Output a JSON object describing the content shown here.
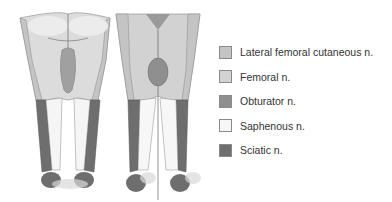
{
  "figure": {
    "posterior_view": "posterior legs",
    "anterior_view": "anterior legs"
  },
  "legend": {
    "items": [
      {
        "label": "Lateral femoral cutaneous n.",
        "color": "#c4c4c4"
      },
      {
        "label": "Femoral n.",
        "color": "#d2d2d2"
      },
      {
        "label": "Obturator n.",
        "color": "#8f8f8f"
      },
      {
        "label": "Saphenous n.",
        "color": "#f7f7f7"
      },
      {
        "label": "Sciatic n.",
        "color": "#6e6e6e"
      }
    ]
  }
}
